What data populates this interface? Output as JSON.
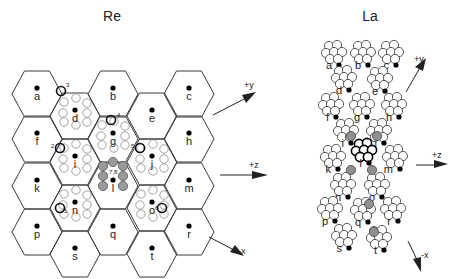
{
  "left_panel": {
    "title": "Re",
    "cells": [
      {
        "id": "a",
        "x": 37,
        "y": 90
      },
      {
        "id": "f",
        "x": 37,
        "y": 135
      },
      {
        "id": "k",
        "x": 37,
        "y": 182
      },
      {
        "id": "p",
        "x": 37,
        "y": 228
      },
      {
        "id": "d",
        "x": 75,
        "y": 112
      },
      {
        "id": "i",
        "x": 75,
        "y": 158
      },
      {
        "id": "n",
        "x": 75,
        "y": 204
      },
      {
        "id": "s",
        "x": 75,
        "y": 250
      },
      {
        "id": "b",
        "x": 113,
        "y": 90
      },
      {
        "id": "g",
        "x": 113,
        "y": 135
      },
      {
        "id": "l",
        "x": 113,
        "y": 182
      },
      {
        "id": "q",
        "x": 113,
        "y": 228
      },
      {
        "id": "e",
        "x": 152,
        "y": 112
      },
      {
        "id": "j",
        "x": 152,
        "y": 158
      },
      {
        "id": "o",
        "x": 152,
        "y": 204
      },
      {
        "id": "t",
        "x": 152,
        "y": 250
      },
      {
        "id": "c",
        "x": 189,
        "y": 90
      },
      {
        "id": "h",
        "x": 189,
        "y": 135
      },
      {
        "id": "m",
        "x": 189,
        "y": 182
      },
      {
        "id": "r",
        "x": 189,
        "y": 228
      }
    ],
    "markers": [
      {
        "text": "3",
        "near": "d"
      },
      {
        "text": "4",
        "near": "g"
      },
      {
        "text": "2",
        "near": "i"
      },
      {
        "text": "5",
        "near": "j"
      },
      {
        "text": "7,8",
        "near": "l"
      },
      {
        "text": "1",
        "near": "n"
      },
      {
        "text": "6",
        "near": "o"
      }
    ],
    "axes": [
      {
        "label": "+y"
      },
      {
        "label": "+z"
      },
      {
        "label": "-x"
      }
    ]
  },
  "right_panel": {
    "title": "La",
    "labels": [
      "a",
      "b",
      "c",
      "d",
      "e",
      "f",
      "g",
      "h",
      "i",
      "j",
      "k",
      "l",
      "m",
      "n",
      "o",
      "p",
      "q",
      "r",
      "s",
      "t"
    ],
    "markers": [
      "8",
      "1",
      "7,8",
      "5",
      "2",
      "4",
      "3"
    ],
    "axes": [
      {
        "label": "+y"
      },
      {
        "label": "+z"
      },
      {
        "label": "-x"
      }
    ]
  },
  "colors": {
    "line": "#3a3a3a",
    "shaded": "#9a9a9a",
    "light_circle": "#8a8a8a"
  }
}
